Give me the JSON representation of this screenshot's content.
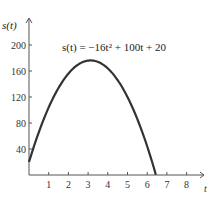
{
  "chart_data": {
    "type": "line",
    "title": "",
    "annotation": "s(t) = −16t² + 100t + 20",
    "xlabel": "t",
    "ylabel": "s(t)",
    "xlim": [
      0,
      8.7
    ],
    "ylim": [
      0,
      230
    ],
    "x_ticks": [
      1,
      2,
      3,
      4,
      5,
      6,
      7,
      8
    ],
    "y_ticks": [
      40,
      80,
      120,
      160,
      200
    ],
    "grid": false,
    "series": [
      {
        "name": "s(t) = -16t^2 + 100t + 20",
        "function": "-16t^2 + 100t + 20",
        "x": [
          0,
          0.5,
          1,
          1.5,
          2,
          2.5,
          3,
          3.125,
          3.5,
          4,
          4.5,
          5,
          5.5,
          6,
          6.44
        ],
        "values": [
          20,
          66,
          104,
          134,
          156,
          170,
          176,
          176.25,
          174,
          164,
          146,
          120,
          86,
          44,
          0
        ]
      }
    ]
  },
  "labels": {
    "ylabel_text": "s(t)",
    "xlabel_text": "t",
    "equation_text": "s(t) = −16t² + 100t + 20",
    "x_tick_labels": [
      "1",
      "2",
      "3",
      "4",
      "5",
      "6",
      "7",
      "8"
    ],
    "y_tick_labels": [
      "40",
      "80",
      "120",
      "160",
      "200"
    ]
  }
}
